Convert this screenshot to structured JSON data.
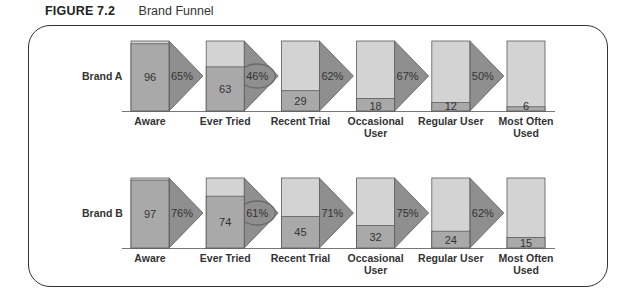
{
  "figure": {
    "number": "FIGURE 7.2",
    "title": "Brand Funnel"
  },
  "colors": {
    "top": "#d3d3d3",
    "fill": "#a9a9a9",
    "arrow": "#8f8f8f",
    "outline": "#5a5a5a",
    "circle": "#6a6a6a"
  },
  "stages": [
    "Aware",
    "Ever Tried",
    "Recent Trial",
    "Occasional User",
    "Regular User",
    "Most Often Used"
  ],
  "brands": [
    {
      "name": "Brand A",
      "values": [
        96,
        63,
        29,
        18,
        12,
        6
      ],
      "conversions": [
        "65%",
        "46%",
        "62%",
        "67%",
        "50%"
      ],
      "highlight": 1
    },
    {
      "name": "Brand B",
      "values": [
        97,
        74,
        45,
        32,
        24,
        15
      ],
      "conversions": [
        "76%",
        "61%",
        "71%",
        "75%",
        "62%"
      ],
      "highlight": 1
    }
  ],
  "chart_data": {
    "type": "bar",
    "title": "Brand Funnel",
    "categories": [
      "Aware",
      "Ever Tried",
      "Recent Trial",
      "Occasional User",
      "Regular User",
      "Most Often Used"
    ],
    "series": [
      {
        "name": "Brand A",
        "values": [
          96,
          63,
          29,
          18,
          12,
          6
        ],
        "conversion_rates": [
          65,
          46,
          62,
          67,
          50
        ]
      },
      {
        "name": "Brand B",
        "values": [
          97,
          74,
          45,
          32,
          24,
          15
        ],
        "conversion_rates": [
          76,
          61,
          71,
          75,
          62
        ]
      }
    ],
    "ylim": [
      0,
      100
    ],
    "annotations": [
      "Ever Tried conversion circled for both brands"
    ]
  }
}
